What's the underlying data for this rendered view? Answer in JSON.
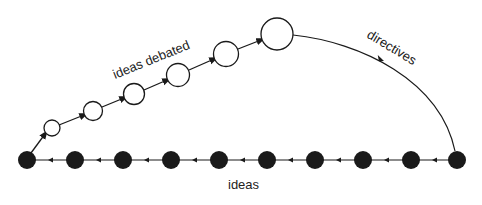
{
  "diagram": {
    "labels": {
      "ideas_debated": "ideas debated",
      "directives": "directives",
      "ideas": "ideas"
    },
    "colors": {
      "stroke": "#1a1a1a",
      "filled_node": "#1a1a1a",
      "open_node_fill": "#ffffff",
      "background": "#ffffff"
    },
    "filled_nodes_count": 10,
    "open_nodes_count": 6
  }
}
